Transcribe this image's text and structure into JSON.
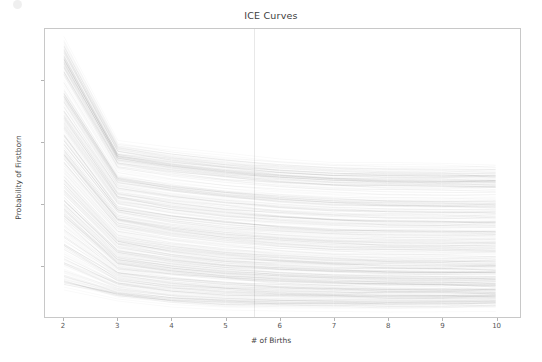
{
  "chart_data": {
    "type": "line",
    "title": "ICE Curves",
    "xlabel": "# of Births",
    "ylabel": "Probability of Firstborn",
    "x": [
      2,
      3,
      4,
      5,
      6,
      7,
      8,
      9,
      10
    ],
    "xtick_labels": [
      "2",
      "3",
      "4",
      "5",
      "6",
      "7",
      "8",
      "9",
      "10"
    ],
    "ytick_labels": [
      "0.3",
      "0.4",
      "0.5",
      "0.6"
    ],
    "ytick_values": [
      0.3,
      0.4,
      0.5,
      0.6
    ],
    "xlim": [
      1.65,
      10.45
    ],
    "ylim": [
      0.215,
      0.685
    ],
    "grid": false,
    "legend": null,
    "legend_position": "none",
    "line_color": "#000000",
    "line_alpha": 0.06,
    "line_width": 0.45,
    "n_curves": 420,
    "band_envelope": {
      "note": "approximate min/max/median of the curve bundle at each x value",
      "x": [
        2,
        3,
        4,
        5,
        6,
        7,
        8,
        9,
        10
      ],
      "max": [
        0.672,
        0.502,
        0.489,
        0.479,
        0.472,
        0.467,
        0.465,
        0.464,
        0.464
      ],
      "q75": [
        0.565,
        0.432,
        0.418,
        0.408,
        0.401,
        0.396,
        0.393,
        0.392,
        0.392
      ],
      "median": [
        0.455,
        0.355,
        0.34,
        0.33,
        0.323,
        0.318,
        0.316,
        0.315,
        0.315
      ],
      "q25": [
        0.375,
        0.3,
        0.288,
        0.28,
        0.275,
        0.272,
        0.27,
        0.269,
        0.269
      ],
      "min": [
        0.258,
        0.245,
        0.236,
        0.232,
        0.231,
        0.231,
        0.231,
        0.232,
        0.233
      ]
    },
    "densest_band": {
      "note": "darkest region of the bundle (mode of curve density)",
      "x": [
        2,
        3,
        4,
        5,
        6,
        7,
        8,
        9,
        10
      ],
      "low": [
        0.4,
        0.305,
        0.292,
        0.284,
        0.279,
        0.276,
        0.274,
        0.274,
        0.274
      ],
      "high": [
        0.52,
        0.392,
        0.377,
        0.366,
        0.359,
        0.354,
        0.352,
        0.351,
        0.351
      ]
    }
  },
  "figure": {
    "background_color": "#ffffff",
    "axes_edge_color": "#c8c8c8",
    "tick_color": "#b4b4b4",
    "text_color": "#555555"
  }
}
